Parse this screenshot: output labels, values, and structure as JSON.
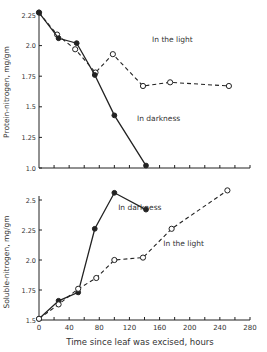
{
  "chart_data": [
    {
      "type": "line",
      "title": "",
      "xlabel": "",
      "ylabel": "Protein-nitrogen,  mg/gm",
      "xlim": [
        0,
        280
      ],
      "ylim": [
        1.0,
        2.25
      ],
      "yticks": [
        1.0,
        1.25,
        1.5,
        1.75,
        2.0,
        2.25
      ],
      "ytick_labels": [
        "1.0",
        "1.25",
        "1.5",
        "1.75",
        "2.0",
        "2.25"
      ],
      "xticks": [
        0,
        20,
        40,
        60,
        80,
        100,
        120,
        140,
        160,
        180,
        200,
        220,
        240,
        260,
        280
      ],
      "grid": false,
      "series": [
        {
          "name": "In the light",
          "style": "dashed",
          "marker": "open-circle",
          "x": [
            0,
            24,
            48,
            75,
            98,
            138,
            174,
            252
          ],
          "y": [
            2.27,
            2.09,
            1.97,
            1.78,
            1.93,
            1.67,
            1.7,
            1.67
          ]
        },
        {
          "name": "In darkness",
          "style": "solid",
          "marker": "filled-circle",
          "x": [
            0,
            26,
            50,
            74,
            100,
            142
          ],
          "y": [
            2.27,
            2.06,
            2.02,
            1.76,
            1.43,
            1.02
          ]
        }
      ],
      "annotations": [
        {
          "text": "In the light",
          "x": 150,
          "y": 2.03
        },
        {
          "text": "In darkness",
          "x": 130,
          "y": 1.38
        }
      ]
    },
    {
      "type": "line",
      "title": "",
      "xlabel": "Time since leaf was excised,  hours",
      "ylabel": "Soluble-nitrogen,  mg/gm",
      "xlim": [
        0,
        280
      ],
      "ylim": [
        1.5,
        2.5
      ],
      "yticks": [
        1.5,
        1.75,
        2.0,
        2.25,
        2.5
      ],
      "ytick_labels": [
        "1.5",
        "1.75",
        "2.0",
        "2.25",
        "2.5"
      ],
      "xticks": [
        0,
        40,
        80,
        120,
        160,
        200,
        240,
        280
      ],
      "xtick_labels": [
        "0",
        "40",
        "80",
        "120",
        "160",
        "200",
        "240",
        "280"
      ],
      "grid": false,
      "series": [
        {
          "name": "In darkness",
          "style": "solid",
          "marker": "filled-circle",
          "x": [
            0,
            26,
            52,
            74,
            100,
            142
          ],
          "y": [
            1.51,
            1.66,
            1.73,
            2.26,
            2.56,
            2.42
          ]
        },
        {
          "name": "In the light",
          "style": "dashed",
          "marker": "open-circle",
          "x": [
            0,
            26,
            52,
            76,
            100,
            138,
            176,
            250
          ],
          "y": [
            1.51,
            1.63,
            1.76,
            1.85,
            2.0,
            2.02,
            2.26,
            2.58
          ]
        }
      ],
      "annotations": [
        {
          "text": "In darkness",
          "x": 105,
          "y": 2.42
        },
        {
          "text": "In the light",
          "x": 165,
          "y": 2.12
        }
      ]
    }
  ]
}
